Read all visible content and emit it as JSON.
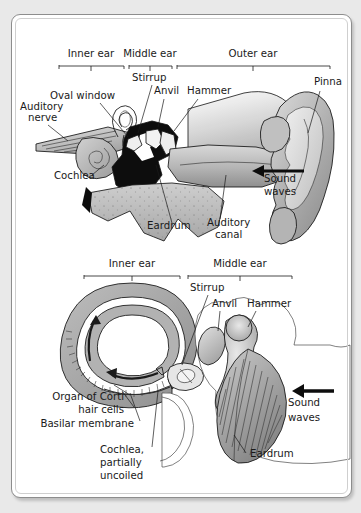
{
  "figure": {
    "panels": [
      {
        "id": "upper",
        "name": "cross-section-whole-ear",
        "region_brackets": [
          {
            "label": "Inner ear",
            "x_start": 47,
            "x_end": 114
          },
          {
            "label": "Middle ear",
            "x_start": 117,
            "x_end": 160
          },
          {
            "label": "Outer ear",
            "x_start": 163,
            "x_end": 318
          }
        ],
        "labels": [
          {
            "text": "Auditory",
            "x": 8,
            "y": 95
          },
          {
            "text": "nerve",
            "x": 16,
            "y": 106
          },
          {
            "text": "Oval window",
            "x": 38,
            "y": 84
          },
          {
            "text": "Stirrup",
            "x": 120,
            "y": 66
          },
          {
            "text": "Anvil",
            "x": 142,
            "y": 79
          },
          {
            "text": "Hammer",
            "x": 175,
            "y": 79
          },
          {
            "text": "Pinna",
            "x": 302,
            "y": 70
          },
          {
            "text": "Cochlea",
            "x": 42,
            "y": 164
          },
          {
            "text": "Eardrum",
            "x": 135,
            "y": 214
          },
          {
            "text": "Auditory",
            "x": 195,
            "y": 211
          },
          {
            "text": "canal",
            "x": 203,
            "y": 223
          },
          {
            "text": "Sound",
            "x": 252,
            "y": 167
          },
          {
            "text": "waves",
            "x": 252,
            "y": 180
          }
        ],
        "arrow": {
          "name": "sound-waves-arrow",
          "direction": "left"
        }
      },
      {
        "id": "lower",
        "name": "cochlea-uncoiled-detail",
        "region_brackets": [
          {
            "label": "Inner ear",
            "x_start": 72,
            "x_end": 170
          },
          {
            "label": "Middle ear",
            "x_start": 176,
            "x_end": 280
          }
        ],
        "labels": [
          {
            "text": "Stirrup",
            "x": 178,
            "y": 276
          },
          {
            "text": "Anvil",
            "x": 200,
            "y": 292
          },
          {
            "text": "Hammer",
            "x": 235,
            "y": 292
          },
          {
            "text": "Organ of Corti",
            "x": 35,
            "y": 385
          },
          {
            "text": "hair cells",
            "x": 65,
            "y": 398
          },
          {
            "text": "Basilar membrane",
            "x": 25,
            "y": 412
          },
          {
            "text": "Cochlea,",
            "x": 88,
            "y": 438
          },
          {
            "text": "partially",
            "x": 88,
            "y": 451
          },
          {
            "text": "uncoiled",
            "x": 88,
            "y": 464
          },
          {
            "text": "Eardrum",
            "x": 238,
            "y": 442
          },
          {
            "text": "Sound",
            "x": 276,
            "y": 391
          },
          {
            "text": "waves",
            "x": 276,
            "y": 406
          }
        ],
        "arrow": {
          "name": "sound-waves-arrow",
          "direction": "left"
        }
      }
    ],
    "colors": {
      "page_background": "#e9e9e9",
      "card_background": "#ffffff",
      "card_border": "#8d8d8d",
      "tissue_light": "#c9c9c9",
      "tissue_mid": "#a8a8a8",
      "tissue_dark": "#8a8a8a",
      "cavity_black": "#0d0d0d",
      "outline": "#141414",
      "text": "#1a1a1a"
    }
  }
}
